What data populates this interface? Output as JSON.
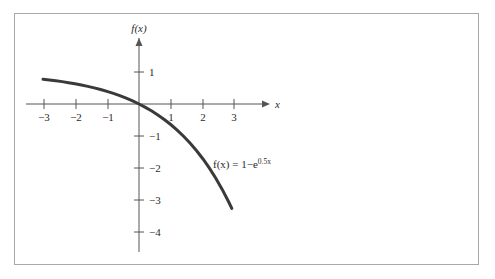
{
  "figure": {
    "background_color": "#ffffff",
    "border_color": "#a9a9a9",
    "axis_color": "#555555",
    "curve_color": "#3a3a3a"
  },
  "axes": {
    "x_axis_name": "x",
    "y_axis_name": "f(x)",
    "x_tick_labels": [
      "−3",
      "−2",
      "−1",
      "1",
      "2",
      "3"
    ],
    "y_tick_labels": [
      "1",
      "−1",
      "−2",
      "−3",
      "−4"
    ]
  },
  "annotations": {
    "curve_label_main": "f(x) = 1−e",
    "curve_label_exponent": "0.5x"
  },
  "chart_data": {
    "type": "line",
    "title": "",
    "xlabel": "x",
    "ylabel": "f(x)",
    "xlim": [
      -3.3,
      3.6
    ],
    "ylim": [
      -4.4,
      1.6
    ],
    "grid": false,
    "legend": "none",
    "annotation": "f(x) = 1−e^{0.5x}",
    "x_ticks": [
      -3,
      -2,
      -1,
      1,
      2,
      3
    ],
    "y_ticks": [
      1,
      -1,
      -2,
      -3,
      -4
    ],
    "series": [
      {
        "name": "f(x) = 1-e^{0.5x}",
        "expression": "1 - Math.exp(0.5*x)",
        "x_start": -3.0,
        "x_end": 2.9,
        "x": [
          -3.0,
          -2.8,
          -2.6,
          -2.4,
          -2.2,
          -2.0,
          -1.8,
          -1.6,
          -1.4,
          -1.2,
          -1.0,
          -0.8,
          -0.6,
          -0.4,
          -0.2,
          0.0,
          0.2,
          0.4,
          0.6,
          0.8,
          1.0,
          1.2,
          1.4,
          1.6,
          1.8,
          2.0,
          2.2,
          2.4,
          2.6,
          2.8,
          2.9
        ],
        "y": [
          0.777,
          0.753,
          0.728,
          0.699,
          0.667,
          0.632,
          0.593,
          0.551,
          0.503,
          0.451,
          0.393,
          0.33,
          0.259,
          0.181,
          0.095,
          0.0,
          -0.105,
          -0.221,
          -0.35,
          -0.492,
          -0.649,
          -0.822,
          -1.014,
          -1.225,
          -1.46,
          -1.718,
          -2.004,
          -2.32,
          -2.669,
          -3.055,
          -3.263
        ]
      }
    ]
  }
}
